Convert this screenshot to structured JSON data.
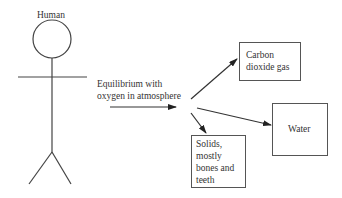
{
  "diagram": {
    "human_label": "Human",
    "process_label_line1": "Equilibrium with",
    "process_label_line2": "oxygen in atmosphere",
    "outputs": [
      {
        "id": "carbon-dioxide",
        "line1": "Carbon",
        "line2": "dioxide gas"
      },
      {
        "id": "water",
        "line1": "Water"
      },
      {
        "id": "solids",
        "line1": "Solids,",
        "line2": "mostly",
        "line3": "bones and",
        "line4": "teeth"
      }
    ],
    "colors": {
      "stroke": "#444444",
      "text": "#333333",
      "background": "#ffffff"
    }
  }
}
